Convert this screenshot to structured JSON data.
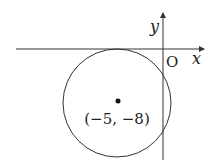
{
  "diagram": {
    "type": "coordinate-circle",
    "axes": {
      "x_label": "x",
      "y_label": "y",
      "origin_label": "O"
    },
    "circle": {
      "center_label": "(−5, −8)",
      "center": [
        -5,
        -8
      ],
      "tangent_to": "x-axis"
    },
    "colors": {
      "stroke": "#333333",
      "background": "#ffffff"
    }
  }
}
